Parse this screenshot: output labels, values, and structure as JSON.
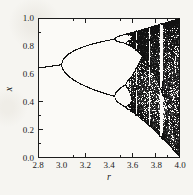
{
  "figure": {
    "page_background": "#f6f5f1",
    "plot_background": "#fbfaf7",
    "frame_color": "#1d1d1d",
    "tick_color": "#1d1d1d",
    "point_color": "#121212"
  },
  "chart_data": {
    "type": "scatter",
    "subtype": "bifurcation-diagram",
    "title": "",
    "xlabel": "r",
    "ylabel": "x",
    "xlim": [
      2.8,
      4.0
    ],
    "ylim": [
      0.0,
      1.0
    ],
    "x_major_ticks": [
      2.8,
      3.0,
      3.2,
      3.4,
      3.6,
      3.8,
      4.0
    ],
    "x_tick_labels": [
      "2.8",
      "3.0",
      "3.2",
      "3.4",
      "3.6",
      "3.8",
      "4.0"
    ],
    "y_major_ticks": [
      0.0,
      0.2,
      0.4,
      0.6,
      0.8,
      1.0
    ],
    "y_tick_labels": [
      "0.0",
      "0.2",
      "0.4",
      "0.6",
      "0.8",
      "1.0"
    ],
    "minor_tick_step": 0.1,
    "grid": false,
    "legend": null,
    "map": "logistic",
    "equation": "x[n+1] = r * x[n] * (1 - x[n])",
    "generator": {
      "x0": 0.51,
      "transient_iterations": 1000,
      "plotted_iterations": 900,
      "columns": 426,
      "periodic_pixel_threshold": 40
    },
    "visible_features": {
      "fixed_point_branch": "x = 1 - 1/r for 2.8 <= r < 3.0 (enters at x ~ 0.64)",
      "period_doubling_r": [
        3.0,
        3.449,
        3.544,
        3.564
      ],
      "chaos_onset_r": 3.57,
      "band_merge_r": 3.68,
      "periodic_windows_r": [
        [
          3.628,
          3.636
        ],
        [
          3.738,
          3.745
        ],
        [
          3.828,
          3.858
        ]
      ],
      "upper_envelope_at_r4": 1.0,
      "lower_envelope_at_r4": 0.0
    }
  }
}
